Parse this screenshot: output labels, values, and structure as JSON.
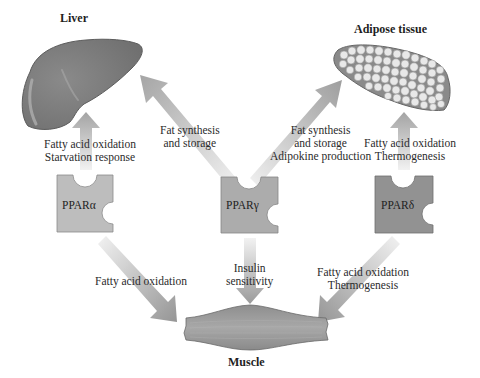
{
  "organs": {
    "liver": {
      "label": "Liver"
    },
    "adipose": {
      "label": "Adipose tissue"
    },
    "muscle": {
      "label": "Muscle"
    }
  },
  "receptors": [
    {
      "label": "PPARα",
      "fill": "#b9b9b9"
    },
    {
      "label": "PPARγ",
      "fill": "#a9a9a9"
    },
    {
      "label": "PPARδ",
      "fill": "#8f8f8f"
    }
  ],
  "effects": {
    "alpha_to_liver": [
      "Fatty acid oxidation",
      "Starvation response"
    ],
    "gamma_to_liver": [
      "Fat synthesis",
      "and storage"
    ],
    "gamma_to_adipose": [
      "Fat synthesis",
      "and storage",
      "Adipokine production"
    ],
    "delta_to_adipose": [
      "Fatty acid oxidation",
      "Thermogenesis"
    ],
    "alpha_to_muscle": [
      "Fatty acid oxidation"
    ],
    "gamma_to_muscle": [
      "Insulin",
      "sensitivity"
    ],
    "delta_to_muscle": [
      "Fatty acid oxidation",
      "Thermogenesis"
    ]
  },
  "colors": {
    "organ_fill": "#7d7d7d",
    "organ_stroke": "#555555",
    "adipose_cell": "#e6e6e6",
    "arrow_light": "#ececec",
    "arrow_dark": "#9a9a9a"
  }
}
